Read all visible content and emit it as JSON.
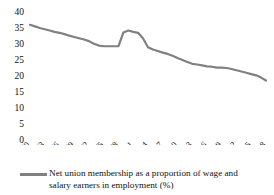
{
  "chart_data": {
    "type": "line",
    "title": "",
    "xlabel": "",
    "ylabel": "",
    "ylim": [
      0,
      40
    ],
    "ytick_step": 5,
    "yticks": [
      "0",
      "5",
      "10",
      "15",
      "20",
      "25",
      "30",
      "35",
      "40"
    ],
    "grid": false,
    "legend_position": "bottom",
    "line_color": "#808080",
    "legend": [
      "Net union membership as a proportion of wage and salary earners in employment (%)"
    ],
    "xtick_labels": [
      "1960",
      "1963",
      "1966",
      "1969",
      "1972",
      "1975",
      "1978",
      "1981",
      "1984",
      "1987",
      "1990",
      "1993",
      "1996",
      "1999",
      "2002",
      "2005",
      "2008"
    ],
    "x": [
      1960,
      1961,
      1962,
      1963,
      1964,
      1965,
      1966,
      1967,
      1968,
      1969,
      1970,
      1971,
      1972,
      1973,
      1974,
      1975,
      1976,
      1977,
      1978,
      1979,
      1980,
      1981,
      1982,
      1983,
      1984,
      1985,
      1986,
      1987,
      1988,
      1989,
      1990,
      1991,
      1992,
      1993,
      1994,
      1995,
      1996,
      1997,
      1998,
      1999,
      2000,
      2001,
      2002,
      2003,
      2004,
      2005,
      2006,
      2007,
      2008
    ],
    "values": [
      36.0,
      35.5,
      35.0,
      34.6,
      34.2,
      33.8,
      33.5,
      33.1,
      32.6,
      32.2,
      31.8,
      31.4,
      30.9,
      30.1,
      29.5,
      29.3,
      29.3,
      29.3,
      29.3,
      33.6,
      34.2,
      33.8,
      33.5,
      31.7,
      29.0,
      28.3,
      27.8,
      27.3,
      26.9,
      26.3,
      25.6,
      25.0,
      24.4,
      23.8,
      23.6,
      23.3,
      23.0,
      22.9,
      22.6,
      22.6,
      22.5,
      22.2,
      21.8,
      21.4,
      21.0,
      20.6,
      20.2,
      19.5,
      18.6
    ],
    "series_name": "Net union membership as a proportion of wage and salary earners in employment (%)"
  },
  "top_artifact": "",
  "legend_label": "Net union membership as a proportion of wage and salary earners in employment (%)"
}
